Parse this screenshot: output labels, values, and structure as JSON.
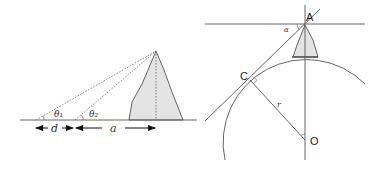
{
  "left_diagram": {
    "labels": {
      "theta1": "θ₁",
      "theta2": "θ₂",
      "d": "d",
      "a": "a"
    }
  },
  "right_diagram": {
    "labels": {
      "A": "A",
      "C": "C",
      "O": "O",
      "r": "r",
      "alpha": "α"
    }
  },
  "colors": {
    "line": "#555555",
    "fill": "#e3e3e3",
    "dotted": "#666666"
  }
}
